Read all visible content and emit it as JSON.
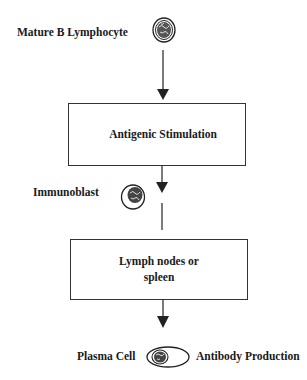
{
  "diagram": {
    "type": "flowchart",
    "nodes": [
      {
        "id": "mature-b-lymphocyte",
        "label": "Mature B Lymphocyte",
        "icon": "lymphocyte-cell-icon"
      },
      {
        "id": "antigenic-stimulation",
        "label": "Antigenic Stimulation",
        "shape": "box"
      },
      {
        "id": "immunoblast",
        "label": "Immunoblast",
        "icon": "immunoblast-cell-icon"
      },
      {
        "id": "lymph-nodes",
        "label_line1": "Lymph nodes or",
        "label_line2": "spleen",
        "shape": "box"
      },
      {
        "id": "plasma-cell",
        "label": "Plasma Cell",
        "icon": "plasma-cell-icon"
      },
      {
        "id": "antibody-production",
        "label": "Antibody Production"
      }
    ],
    "edges": [
      {
        "from": "mature-b-lymphocyte",
        "to": "antigenic-stimulation"
      },
      {
        "from": "antigenic-stimulation",
        "to": "immunoblast"
      },
      {
        "from": "immunoblast",
        "to": "lymph-nodes"
      },
      {
        "from": "lymph-nodes",
        "to": "plasma-cell"
      }
    ],
    "colors": {
      "line": "#333333",
      "text": "#1a1a1a",
      "background": "#ffffff"
    }
  }
}
